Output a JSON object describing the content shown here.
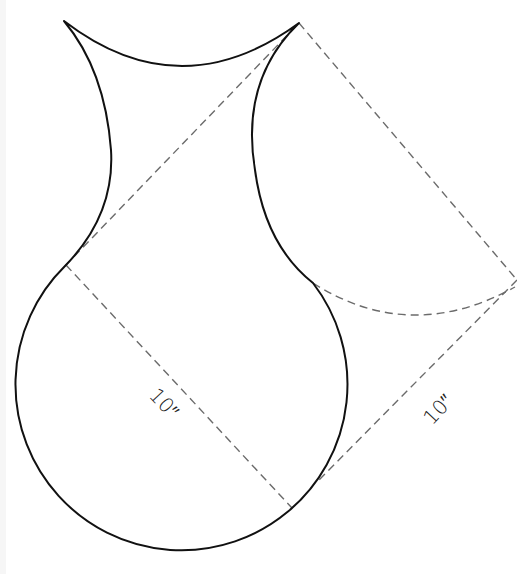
{
  "diagram": {
    "labels": {
      "diameter": "10″",
      "square_side": "10″"
    },
    "colors": {
      "outline": "#111111",
      "construction": "#6b6b6b",
      "background": "#ffffff"
    }
  }
}
